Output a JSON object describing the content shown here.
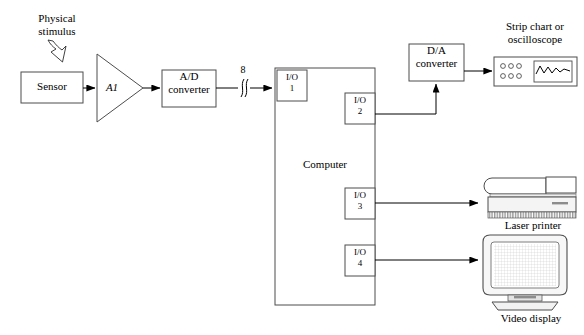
{
  "figure": {
    "domain": "Diagram",
    "background_color": "#ffffff",
    "line_color": "#000000",
    "fill_color": "#ffffff"
  },
  "blocks": {
    "physical_stimulus": {
      "label_line1": "Physical",
      "label_line2": "stimulus",
      "icon": "hollow-arrow-down-right"
    },
    "sensor": {
      "label": "Sensor"
    },
    "amplifier": {
      "label": "A1",
      "shape": "triangle",
      "style": "italic"
    },
    "ad_converter": {
      "label_line1": "A/D",
      "label_line2": "converter"
    },
    "bus": {
      "width_label": "8",
      "marker": "bus-slash"
    },
    "computer": {
      "label": "Computer",
      "ports": [
        {
          "name": "I/O",
          "number": "1",
          "side": "left"
        },
        {
          "name": "I/O",
          "number": "2",
          "side": "right"
        },
        {
          "name": "I/O",
          "number": "3",
          "side": "right"
        },
        {
          "name": "I/O",
          "number": "4",
          "side": "right"
        }
      ]
    },
    "da_converter": {
      "label_line1": "D/A",
      "label_line2": "converter"
    },
    "strip_chart": {
      "label_line1": "Strip chart or",
      "label_line2": "oscilloscope",
      "knob_rows": 2,
      "knobs_per_row": 3,
      "screen": "waveform"
    },
    "laser_printer": {
      "label": "Laser printer"
    },
    "video_display": {
      "label": "Video display"
    }
  },
  "connections": [
    {
      "from": "sensor",
      "to": "amplifier"
    },
    {
      "from": "amplifier",
      "to": "ad_converter"
    },
    {
      "from": "ad_converter",
      "to": "io_1",
      "annotation": "8"
    },
    {
      "from": "io_2",
      "to": "da_converter"
    },
    {
      "from": "da_converter",
      "to": "strip_chart"
    },
    {
      "from": "io_3",
      "to": "laser_printer"
    },
    {
      "from": "io_4",
      "to": "video_display"
    }
  ]
}
